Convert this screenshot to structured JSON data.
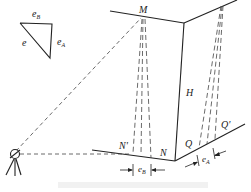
{
  "figure": {
    "labels": {
      "M": "M",
      "H": "H",
      "N": "N",
      "N_prime": "N'",
      "Q": "Q",
      "Q_prime": "Q'",
      "e": "e",
      "eA_base": "e",
      "eA_sub": "A",
      "eB_base": "e",
      "eB_sub": "B",
      "eA_dim_base": "e",
      "eA_dim_sub": "A",
      "eB_dim_base": "e",
      "eB_dim_sub": "B"
    },
    "colors": {
      "line": "#222222",
      "dash": "#444444",
      "background": "#ffffff"
    },
    "elements": [
      "error-triangle",
      "building-corner",
      "theodolite",
      "sight-lines",
      "plumb-projections",
      "dimension-eA",
      "dimension-eB"
    ]
  }
}
